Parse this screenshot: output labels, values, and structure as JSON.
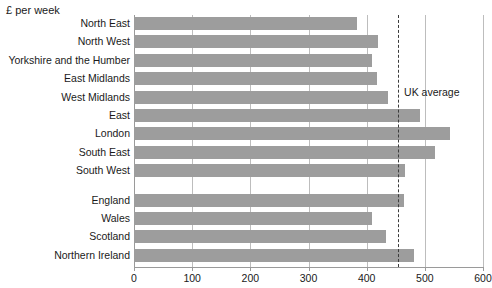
{
  "chart_data": {
    "type": "bar",
    "orientation": "horizontal",
    "title": "",
    "unit_caption": "£ per week",
    "xlabel": "",
    "ylabel": "",
    "xlim": [
      0,
      600
    ],
    "xticks": [
      0,
      100,
      200,
      300,
      400,
      500,
      600
    ],
    "xtick_labels": [
      "0",
      "100",
      "200",
      "300",
      "400",
      "500",
      "600"
    ],
    "grid": true,
    "grid_axis": "x",
    "legend": "none",
    "bar_color": "#9d9d9d",
    "groups": [
      {
        "name": "English regions",
        "categories": [
          "North East",
          "North West",
          "Yorkshire and the Humber",
          "East Midlands",
          "West Midlands",
          "East",
          "London",
          "South East",
          "South West"
        ],
        "values": [
          383,
          419,
          409,
          418,
          436,
          492,
          543,
          517,
          466
        ]
      },
      {
        "name": "Countries",
        "categories": [
          "England",
          "Wales",
          "Scotland",
          "Northern Ireland"
        ],
        "values": [
          464,
          409,
          433,
          481
        ]
      }
    ],
    "categories": [
      "North East",
      "North West",
      "Yorkshire and the Humber",
      "East Midlands",
      "West Midlands",
      "East",
      "London",
      "South East",
      "South West",
      "England",
      "Wales",
      "Scotland",
      "Northern Ireland"
    ],
    "values": [
      383,
      419,
      409,
      418,
      436,
      492,
      543,
      517,
      466,
      464,
      409,
      433,
      481
    ],
    "annotations": [
      {
        "name": "uk-average",
        "label": "UK average",
        "value": 454,
        "style": "dashed-vertical-line"
      }
    ]
  }
}
